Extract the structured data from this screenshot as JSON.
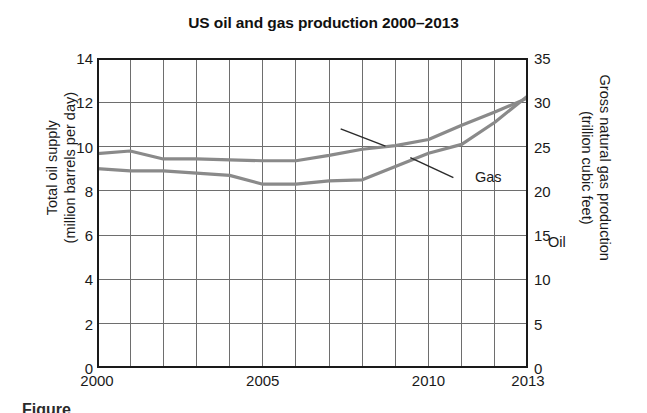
{
  "chart_data": {
    "type": "line",
    "title": "US oil and gas production 2000–2013",
    "xlabel": "",
    "ylabel": "Total oil supply (million barrels per day)",
    "ylabel_line1": "Total oil supply",
    "ylabel_line2": "(million barrels per day)",
    "y2label": "Gross natural gas production (trillion cubic feet)",
    "y2label_line1": "Gross natural gas production",
    "y2label_line2": "(trillion cubic feet)",
    "x": [
      2000,
      2001,
      2002,
      2003,
      2004,
      2005,
      2006,
      2007,
      2008,
      2009,
      2010,
      2011,
      2012,
      2013
    ],
    "xlim": [
      2000,
      2013
    ],
    "ylim": [
      0,
      14
    ],
    "y2lim": [
      0,
      35
    ],
    "yticks": [
      0,
      2,
      4,
      6,
      8,
      10,
      12,
      14
    ],
    "y2ticks": [
      0,
      5,
      10,
      15,
      20,
      25,
      30,
      35
    ],
    "xticks": [
      2000,
      2005,
      2010,
      2013
    ],
    "xticklabels": [
      "2000",
      "2005",
      "2010",
      "2013"
    ],
    "grid": "both",
    "legend": "inline-annotations",
    "line_color": "#8a8a8a",
    "axis_color": "#1a1a1a",
    "grid_color": "#6e6e6e",
    "series": [
      {
        "name": "Gas",
        "axis": "right",
        "units": "trillion cubic feet",
        "values": [
          24.2,
          24.5,
          23.6,
          23.6,
          23.5,
          23.4,
          23.4,
          24.0,
          24.7,
          25.1,
          25.8,
          27.4,
          28.9,
          30.5
        ],
        "values_left_axis_equivalent": [
          9.7,
          9.8,
          9.45,
          9.45,
          9.4,
          9.35,
          9.35,
          9.6,
          9.9,
          10.05,
          10.3,
          10.95,
          11.55,
          12.2
        ],
        "label": "Gas"
      },
      {
        "name": "Oil",
        "axis": "left",
        "units": "million barrels per day",
        "values": [
          9.0,
          8.9,
          8.9,
          8.8,
          8.7,
          8.3,
          8.3,
          8.45,
          8.5,
          9.1,
          9.7,
          10.1,
          11.1,
          12.3
        ],
        "label": "Oil"
      }
    ],
    "annotations": [
      {
        "text": "Gas",
        "points_to": "upper-line",
        "x": 2008.5,
        "y_axis": "right"
      },
      {
        "text": "Oil",
        "points_to": "lower-line",
        "x": 2010.9,
        "y_axis": "left"
      }
    ]
  },
  "caption": "Figure"
}
